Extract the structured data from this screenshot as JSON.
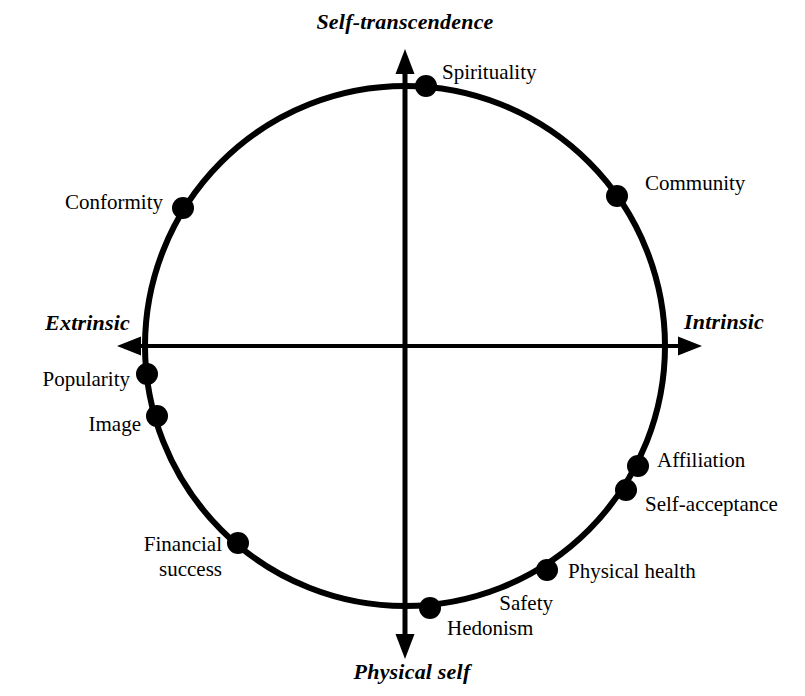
{
  "figure": {
    "type": "circumplex-diagram",
    "title_visible": false,
    "background_color": "#ffffff",
    "stroke_color": "#000000"
  },
  "axes": {
    "vertical": {
      "top_label": "Self-transcendence",
      "bottom_label": "Physical self"
    },
    "horizontal": {
      "left_label": "Extrinsic",
      "right_label": "Intrinsic"
    }
  },
  "chart_data": {
    "type": "scatter",
    "subtype": "circumplex",
    "title": "",
    "xlabel": "Extrinsic — Intrinsic",
    "ylabel": "Physical self — Self-transcendence",
    "axis_labels": {
      "top": "Self-transcendence",
      "bottom": "Physical self",
      "left": "Extrinsic",
      "right": "Intrinsic"
    },
    "circle": {
      "center_x": 405,
      "center_y": 346,
      "radius": 260,
      "stroke_width": 6
    },
    "grid": false,
    "legend": false,
    "points": [
      {
        "label": "Spirituality",
        "angle_deg": 85,
        "cx": 426,
        "cy": 86,
        "label_x": 442,
        "label_y": 72,
        "anchor": "left",
        "lines": [
          "Spirituality"
        ]
      },
      {
        "label": "Community",
        "angle_deg": 56.5,
        "cx": 617,
        "cy": 196,
        "label_x": 645,
        "label_y": 183,
        "anchor": "left",
        "lines": [
          "Community"
        ]
      },
      {
        "label": "Affiliation",
        "angle_deg": -27.5,
        "cx": 638,
        "cy": 466,
        "label_x": 657,
        "label_y": 460,
        "anchor": "left",
        "lines": [
          "Affiliation"
        ]
      },
      {
        "label": "Self-acceptance",
        "angle_deg": -33.5,
        "cx": 626,
        "cy": 490,
        "label_x": 645,
        "label_y": 504,
        "anchor": "left",
        "lines": [
          "Self-acceptance"
        ]
      },
      {
        "label": "Physical health",
        "angle_deg": -59.5,
        "cx": 547,
        "cy": 570,
        "label_x": 568,
        "label_y": 571,
        "anchor": "left",
        "lines": [
          "Physical health"
        ]
      },
      {
        "label": "Safety",
        "angle_deg": -59.5,
        "cx": 547,
        "cy": 570,
        "label_x": 553,
        "label_y": 603,
        "anchor": "right",
        "lines": [
          "Safety"
        ]
      },
      {
        "label": "Hedonism",
        "angle_deg": -84.5,
        "cx": 430,
        "cy": 608,
        "label_x": 447,
        "label_y": 628,
        "anchor": "left",
        "lines": [
          "Hedonism"
        ]
      },
      {
        "label": "Financial success",
        "angle_deg": -130,
        "cx": 238,
        "cy": 543,
        "label_x": 222,
        "label_y": 557,
        "anchor": "right",
        "lines": [
          "Financial",
          "success"
        ]
      },
      {
        "label": "Image",
        "angle_deg": -164,
        "cx": 157,
        "cy": 416,
        "label_x": 141,
        "label_y": 424,
        "anchor": "right",
        "lines": [
          "Image"
        ]
      },
      {
        "label": "Popularity",
        "angle_deg": -173.8,
        "cx": 147,
        "cy": 374,
        "label_x": 130,
        "label_y": 379,
        "anchor": "right",
        "lines": [
          "Popularity"
        ]
      },
      {
        "label": "Conformity",
        "angle_deg": 147.5,
        "cx": 183,
        "cy": 208,
        "label_x": 163,
        "label_y": 202,
        "anchor": "right",
        "lines": [
          "Conformity"
        ]
      }
    ],
    "point_marker": {
      "shape": "filled-circle",
      "radius": 11,
      "color": "#000000"
    }
  },
  "axis_label_positions": {
    "top": {
      "x": 405,
      "y": 22
    },
    "bottom": {
      "x": 412,
      "y": 672
    },
    "left": {
      "x": 124,
      "y": 323
    },
    "right": {
      "x": 684,
      "y": 322
    }
  }
}
